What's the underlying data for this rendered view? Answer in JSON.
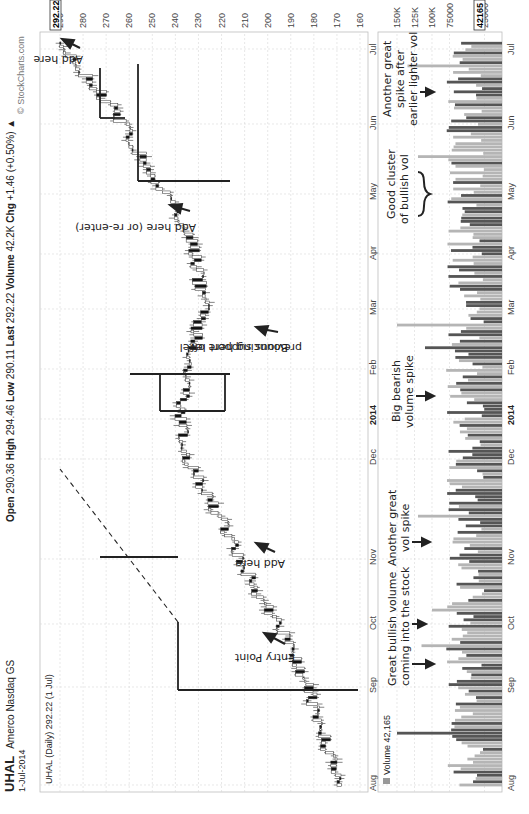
{
  "header": {
    "symbol": "UHAL",
    "company": "Amerco Nasdaq GS",
    "date": "1-Jul-2014",
    "series_label": "UHAL (Daily) 292.22 (1 Jul)",
    "open_label": "Open",
    "open": "290.36",
    "high_label": "High",
    "high": "294.46",
    "low_label": "Low",
    "low": "290.11",
    "last_label": "Last",
    "last": "292.22",
    "volume_label": "Volume",
    "volume": "42.2K",
    "chg_label": "Chg",
    "chg": "+1.46 (+0.50%)",
    "chg_arrow": "▲",
    "copyright": "© StockCharts.com"
  },
  "price_axis": {
    "ticks": [
      "290",
      "280",
      "270",
      "260",
      "250",
      "240",
      "230",
      "220",
      "210",
      "200",
      "190",
      "180",
      "170",
      "160"
    ],
    "last_tag": "292.22"
  },
  "volume_axis": {
    "ticks": [
      "150K",
      "125K",
      "100K",
      "75000",
      "25000"
    ],
    "last_tag": "42165",
    "legend": "Volume 42,165"
  },
  "date_axis": {
    "labels": [
      "Aug",
      "Sep",
      "Oct",
      "Nov",
      "Dec",
      "2014",
      "Feb",
      "Mar",
      "Apr",
      "May",
      "Jun",
      "Jul"
    ]
  },
  "annotations": {
    "entry_point": "Entry Point",
    "add_here_1": "Add here",
    "bouncing_1": "Bouncing here off",
    "bouncing_2": "previous support level",
    "add_reenter": "Add here (or re-enter)",
    "add_here_2": "Add here",
    "vol_bullish_1": "Great bullish volume",
    "vol_bullish_2": "coming into the stock",
    "vol_another_1": "Another great",
    "vol_another_2": "vol spike",
    "vol_bearish_1": "Big bearish",
    "vol_bearish_2": "volume spike",
    "vol_cluster_1": "Good cluster",
    "vol_cluster_2": "of bullish vol",
    "vol_after_1": "Another great",
    "vol_after_2": "spike after",
    "vol_after_3": "earlier lighter vol"
  },
  "colors": {
    "up": "#ffffff",
    "down": "#111111",
    "vol_up": "#b5b5b5",
    "vol_down": "#555555",
    "grid": "#d8d8d8"
  },
  "chart_data": [
    {
      "type": "line",
      "title": "UHAL Amerco Nasdaq GS (Daily) candlestick",
      "xlabel": "",
      "ylabel": "Price",
      "ylim": [
        158,
        294
      ],
      "x": [
        "Aug 2013",
        "Sep",
        "Oct",
        "Nov",
        "Dec",
        "2014",
        "Feb",
        "Mar",
        "Apr",
        "May",
        "Jun",
        "Jul 2014"
      ],
      "series": [
        {
          "name": "UHAL close (approx monthly)",
          "values": [
            170,
            178,
            190,
            207,
            222,
            238,
            236,
            228,
            232,
            250,
            268,
            292
          ]
        }
      ],
      "last": 292.22,
      "grid": true,
      "annotations": [
        "Entry Point ~180 (late Sep)",
        "Add here ~208 (early Nov)",
        "Bouncing here off previous support level ~211 (Feb)",
        "Add here (or re-enter) ~240 (late Apr)",
        "Add here ~275 (mid Jun)",
        "Dashed trendline from Oct to Jan"
      ]
    },
    {
      "type": "bar",
      "title": "Volume",
      "ylabel": "Volume",
      "ylim": [
        0,
        160000
      ],
      "x": [
        "Aug",
        "Sep",
        "Oct",
        "Nov",
        "Dec",
        "2014",
        "Feb",
        "Mar",
        "Apr",
        "May",
        "Jun",
        "Jul"
      ],
      "series": [
        {
          "name": "Volume (typical monthly)",
          "values": [
            60000,
            70000,
            85000,
            75000,
            65000,
            70000,
            80000,
            55000,
            75000,
            70000,
            60000,
            50000
          ]
        }
      ],
      "last": 42165,
      "spikes": [
        {
          "date": "early Sep 2013",
          "value": 150000,
          "kind": "down"
        },
        {
          "date": "Feb 2014",
          "value": 150000,
          "kind": "up"
        },
        {
          "date": "late Jan 2014",
          "value": 110000,
          "kind": "down",
          "note": "Big bearish volume spike"
        },
        {
          "date": "late Jun 2014",
          "value": 135000,
          "kind": "up"
        }
      ]
    }
  ]
}
